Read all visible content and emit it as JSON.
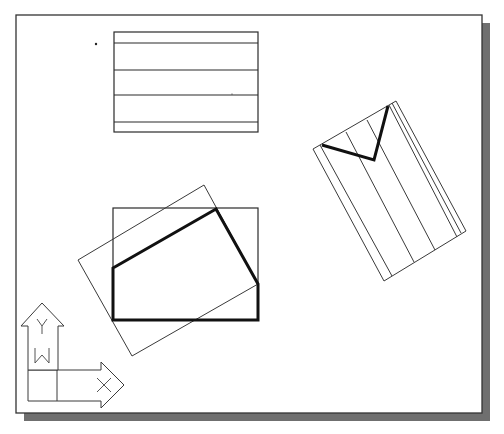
{
  "view": {
    "width": 504,
    "height": 434,
    "background": "#ffffff"
  },
  "frame": {
    "x": 16,
    "y": 15,
    "width": 466,
    "height": 398,
    "stroke": "#333333",
    "fill": "#ffffff",
    "shadow": {
      "offset_x": 8,
      "offset_y": 8,
      "color": "#6f6f6f"
    }
  },
  "stray_points": [
    {
      "x": 96,
      "y": 44,
      "r": 1.2
    },
    {
      "x": 232,
      "y": 94,
      "r": 0.6
    }
  ],
  "objects": {
    "top_rectangle": {
      "x": 114,
      "y": 32,
      "width": 144,
      "height": 100,
      "hlines_y": [
        43,
        70,
        95,
        122
      ]
    },
    "right_rotated_rect": {
      "corners": [
        [
          313,
          149
        ],
        [
          396,
          101
        ],
        [
          466,
          231
        ],
        [
          384,
          281
        ]
      ],
      "inner_lines": [
        [
          [
            320,
            145
          ],
          [
            392,
            276
          ]
        ],
        [
          [
            346,
            132
          ],
          [
            414,
            262
          ]
        ],
        [
          [
            367,
            120
          ],
          [
            435,
            250
          ]
        ],
        [
          [
            389,
            105
          ],
          [
            457,
            237
          ]
        ],
        [
          [
            392,
            103
          ],
          [
            461,
            233
          ]
        ]
      ],
      "bold_polyline": [
        [
          322,
          145
        ],
        [
          374,
          160
        ],
        [
          388,
          106
        ]
      ]
    },
    "bottom_group": {
      "axis_rect": {
        "x": 113,
        "y": 208,
        "width": 145,
        "height": 112
      },
      "rotated_rect": [
        [
          204,
          185
        ],
        [
          258,
          284
        ],
        [
          132,
          356
        ],
        [
          78,
          260
        ]
      ],
      "bold_polygon": [
        [
          113,
          268
        ],
        [
          216,
          209
        ],
        [
          258,
          284
        ],
        [
          258,
          320
        ],
        [
          113,
          320
        ]
      ]
    }
  },
  "ucs_icon": {
    "label_y": "Y",
    "label_w": "W",
    "label_x": "X",
    "y_arrow": [
      [
        28,
        370
      ],
      [
        28,
        326
      ],
      [
        21,
        326
      ],
      [
        42,
        303
      ],
      [
        64,
        326
      ],
      [
        58,
        326
      ],
      [
        58,
        370
      ]
    ],
    "x_arrow": [
      [
        58,
        370
      ],
      [
        101,
        370
      ],
      [
        101,
        362
      ],
      [
        124,
        385
      ],
      [
        101,
        408
      ],
      [
        101,
        401
      ],
      [
        28,
        401
      ],
      [
        28,
        370
      ]
    ],
    "divider_v": [
      [
        57,
        370
      ],
      [
        57,
        401
      ]
    ],
    "y_letter": {
      "x": 42,
      "y": 327
    },
    "w_letter": {
      "x": 42,
      "y": 356
    },
    "x_letter": {
      "x": 104,
      "y": 385
    }
  }
}
